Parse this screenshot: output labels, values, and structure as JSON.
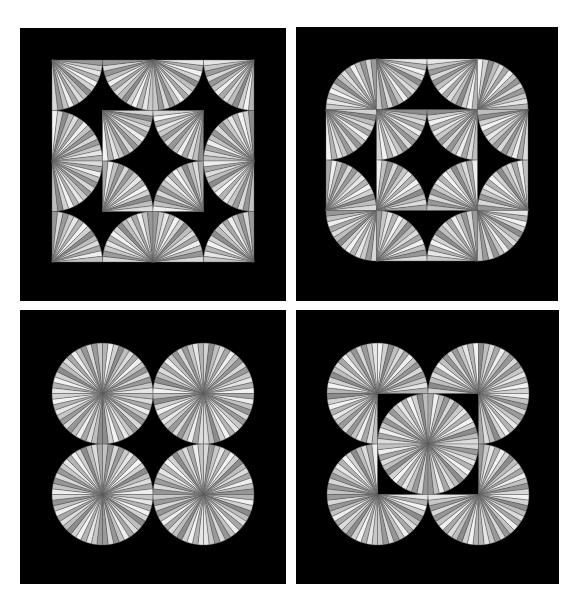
{
  "figure": {
    "background": "#ffffff",
    "panel_color": "#000000",
    "blade_edge_color": "#555555",
    "blade_shades": [
      "#9a9a9a",
      "#c8c8c8",
      "#e6e6e6",
      "#b4b4b4",
      "#f2f2f2",
      "#d2d2d2",
      "#8c8c8c",
      "#bebebe",
      "#dcdcdc",
      "#a8a8a8",
      "#eeeeee",
      "#c2c2c2",
      "#969696",
      "#d8d8d8"
    ],
    "block_size": 50.5,
    "panels": [
      {
        "id": "top-left",
        "x": 20,
        "y": 28,
        "w": 266,
        "h": 273,
        "grid_x": 32,
        "grid_y": 32,
        "pivots": [
          [
            "tl",
            "tr",
            "tl",
            "tr"
          ],
          [
            "bl",
            "tl",
            "tr",
            "br"
          ],
          [
            "tl",
            "bl",
            "br",
            "tr"
          ],
          [
            "bl",
            "br",
            "bl",
            "br"
          ]
        ]
      },
      {
        "id": "top-right",
        "x": 296,
        "y": 27,
        "w": 262,
        "h": 274,
        "grid_x": 30,
        "grid_y": 32,
        "pivots": [
          [
            "br",
            "tl",
            "tr",
            "bl"
          ],
          [
            "tl",
            "tl",
            "tr",
            "tr"
          ],
          [
            "bl",
            "bl",
            "br",
            "br"
          ],
          [
            "tr",
            "bl",
            "br",
            "tl"
          ]
        ]
      },
      {
        "id": "bottom-left",
        "x": 20,
        "y": 310,
        "w": 266,
        "h": 274,
        "grid_x": 32,
        "grid_y": 33,
        "pivots": [
          [
            "br",
            "bl",
            "br",
            "bl"
          ],
          [
            "tr",
            "tl",
            "tr",
            "tl"
          ],
          [
            "br",
            "bl",
            "br",
            "bl"
          ],
          [
            "tr",
            "tl",
            "tr",
            "tl"
          ]
        ]
      },
      {
        "id": "bottom-right",
        "x": 296,
        "y": 310,
        "w": 263,
        "h": 274,
        "grid_x": 31,
        "grid_y": 33,
        "pivots": [
          [
            "br",
            "bl",
            "br",
            "bl"
          ],
          [
            "tr",
            "br",
            "bl",
            "tl"
          ],
          [
            "br",
            "tr",
            "tl",
            "bl"
          ],
          [
            "tr",
            "tl",
            "tr",
            "tl"
          ]
        ]
      }
    ]
  }
}
